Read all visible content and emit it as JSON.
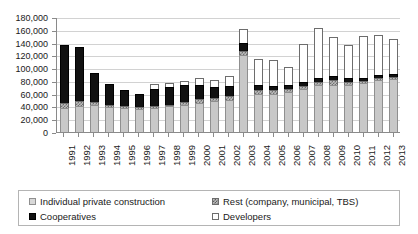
{
  "chart_data": {
    "type": "bar",
    "stacked": true,
    "title": "",
    "xlabel": "",
    "ylabel": "",
    "ylim": [
      0,
      180000
    ],
    "ytick_step": 20000,
    "ytick_labels": [
      "180,000",
      "160,000",
      "140,000",
      "120,000",
      "100,000",
      "80,000",
      "60,000",
      "40,000",
      "20,000",
      "0"
    ],
    "ytick_values": [
      180000,
      160000,
      140000,
      120000,
      100000,
      80000,
      60000,
      40000,
      20000,
      0
    ],
    "grid": true,
    "legend_position": "bottom",
    "categories": [
      "1991",
      "1992",
      "1993",
      "1994",
      "1995",
      "1996",
      "1997",
      "1998",
      "1999",
      "2000",
      "2001",
      "2002",
      "2003",
      "2004",
      "2005",
      "2006",
      "2007",
      "2008",
      "2009",
      "2010",
      "2011",
      "2012",
      "2013"
    ],
    "series": [
      {
        "name": "Individual private construction",
        "color": "#c8c8c8",
        "pattern": "solid-light-gray",
        "values": [
          38000,
          40000,
          42000,
          39000,
          38000,
          36000,
          38000,
          40000,
          43000,
          46000,
          48000,
          50000,
          120000,
          60000,
          60000,
          62000,
          67000,
          74000,
          74000,
          74000,
          76000,
          81000,
          83000
        ]
      },
      {
        "name": "Rest (company, municipal, TBS)",
        "color": "#bdbdbd",
        "pattern": "checkered-gray",
        "values": [
          8000,
          8000,
          5000,
          3000,
          3000,
          3000,
          3000,
          3000,
          4000,
          5000,
          6000,
          7000,
          7000,
          6000,
          5000,
          5000,
          5000,
          5000,
          7000,
          5000,
          4000,
          3000,
          3000
        ]
      },
      {
        "name": "Cooperatives",
        "color": "#111111",
        "pattern": "solid-black",
        "values": [
          91000,
          85000,
          46000,
          33000,
          25000,
          21000,
          27000,
          27000,
          27000,
          22000,
          17000,
          15000,
          13000,
          8000,
          7000,
          6000,
          6000,
          6000,
          6000,
          5000,
          5000,
          5000,
          5000
        ]
      },
      {
        "name": "Developers",
        "color": "#ffffff",
        "pattern": "open-white",
        "values": [
          0,
          0,
          0,
          0,
          0,
          0,
          7000,
          6000,
          6000,
          11000,
          10000,
          15000,
          22000,
          41000,
          41000,
          29000,
          60000,
          78000,
          61000,
          53000,
          66000,
          63000,
          54000
        ]
      }
    ],
    "totals": [
      137000,
      133000,
      93000,
      75000,
      66000,
      60000,
      75000,
      76000,
      80000,
      84000,
      81000,
      87000,
      162000,
      115000,
      113000,
      102000,
      138000,
      163000,
      148000,
      137000,
      151000,
      152000,
      145000
    ]
  },
  "legend": {
    "items": [
      {
        "label": "Individual private construction",
        "swatch": "light-gray-swatch"
      },
      {
        "label": "Rest (company, municipal, TBS)",
        "swatch": "checkered-gray-swatch"
      },
      {
        "label": "Cooperatives",
        "swatch": "black-swatch"
      },
      {
        "label": "Developers",
        "swatch": "white-swatch"
      }
    ]
  }
}
